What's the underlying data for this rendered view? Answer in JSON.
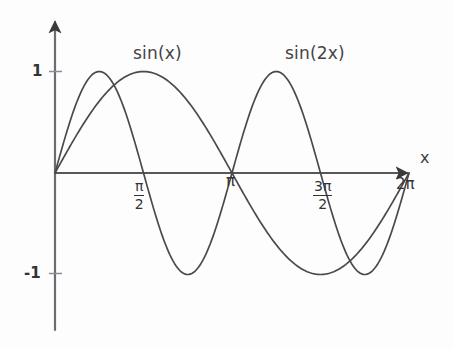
{
  "figure": {
    "background_color": "#fdfdfd",
    "ink_color": "#3a3a3a",
    "style": "hand-drawn pencil sketch",
    "axis_label_x": "x",
    "y_tick_top": "1",
    "y_tick_bottom": "-1",
    "curve_label_1": "sin(x)",
    "curve_label_2": "sin(2x)",
    "x_tick_pi_over_2_num": "π",
    "x_tick_pi_over_2_den": "2",
    "x_tick_pi": "π",
    "x_tick_3pi_over_2_num": "3π",
    "x_tick_3pi_over_2_den": "2",
    "x_tick_2pi": "2π"
  },
  "chart_data": {
    "type": "line",
    "title": "",
    "subtitle": "",
    "xlabel": "x",
    "ylabel": "",
    "xlim": [
      0,
      6.283185307179586
    ],
    "ylim": [
      -1,
      1
    ],
    "grid": false,
    "legend": "inline annotations above curves",
    "x_tick_values": [
      0,
      1.5707963,
      3.1415927,
      4.712389,
      6.2831853
    ],
    "x_tick_labels": [
      "",
      "π/2",
      "π",
      "3π/2",
      "2π"
    ],
    "y_tick_values": [
      -1,
      1
    ],
    "y_tick_labels": [
      "-1",
      "1"
    ],
    "series": [
      {
        "name": "sin(x)",
        "formula": "y = sin(x)",
        "color": "#3a3a3a",
        "x": [
          0,
          0.3926991,
          0.7853982,
          1.1780972,
          1.5707963,
          1.9634954,
          2.3561945,
          2.7488936,
          3.1415927,
          3.5342917,
          3.9269908,
          4.3196899,
          4.712389,
          5.1050881,
          5.4977871,
          5.8904862,
          6.2831853
        ],
        "values": [
          0,
          0.3827,
          0.7071,
          0.9239,
          1,
          0.9239,
          0.7071,
          0.3827,
          0,
          -0.3827,
          -0.7071,
          -0.9239,
          -1,
          -0.9239,
          -0.7071,
          -0.3827,
          0
        ]
      },
      {
        "name": "sin(2x)",
        "formula": "y = sin(2x)",
        "color": "#3a3a3a",
        "x": [
          0,
          0.3926991,
          0.7853982,
          1.1780972,
          1.5707963,
          1.9634954,
          2.3561945,
          2.7488936,
          3.1415927,
          3.5342917,
          3.9269908,
          4.3196899,
          4.712389,
          5.1050881,
          5.4977871,
          5.8904862,
          6.2831853
        ],
        "values": [
          0,
          0.7071,
          1,
          0.7071,
          0,
          -0.7071,
          -1,
          -0.7071,
          0,
          0.7071,
          1,
          0.7071,
          0,
          -0.7071,
          -1,
          -0.7071,
          0
        ]
      }
    ],
    "annotations": [
      {
        "text": "sin(x)",
        "x": 1.93,
        "y": 1.32
      },
      {
        "text": "sin(2x)",
        "x": 5.0,
        "y": 1.32
      }
    ]
  }
}
